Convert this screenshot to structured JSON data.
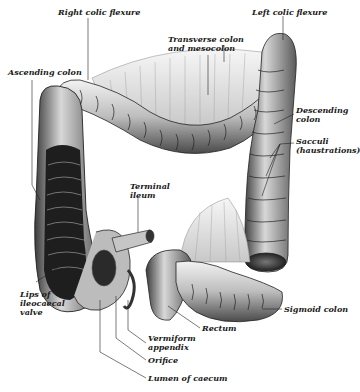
{
  "figure": {
    "style": "grayscale engraving",
    "colors": {
      "ink": "#1a1a1a",
      "tissue_light": "#e6e6e6",
      "tissue_mid": "#9a9a9a",
      "tissue_dark": "#2a2a2a",
      "background": "#ffffff"
    }
  },
  "labels": {
    "right_colic_flexure": "Right colic flexure",
    "left_colic_flexure": "Left colic flexure",
    "transverse_line1": "Transverse colon",
    "transverse_line2": "and mesocolon",
    "ascending_colon": "Ascending colon",
    "descending_line1": "Descending",
    "descending_line2": "colon",
    "sacculi_line1": "Sacculi",
    "sacculi_line2": "(haustrations)",
    "terminal_line1": "Terminal",
    "terminal_line2": "ileum",
    "lips_line1": "Lips of",
    "lips_line2": "ileocaecal",
    "lips_line3": "valve",
    "vermiform_line1": "Vermiform",
    "vermiform_line2": "appendix",
    "rectum": "Rectum",
    "sigmoid_colon": "Sigmoid colon",
    "orifice": "Orifice",
    "lumen_of_caecum": "Lumen of caecum"
  }
}
